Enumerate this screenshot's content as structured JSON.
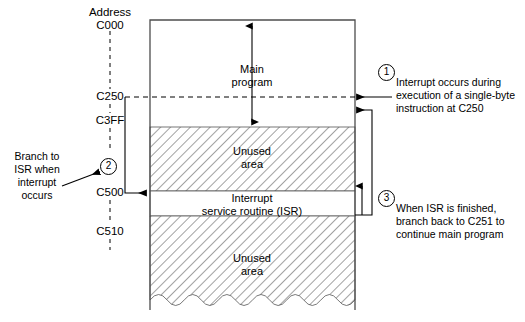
{
  "figure": {
    "type": "memory-map-interrupt-diagram"
  },
  "address_column": {
    "header": "Address",
    "labels": [
      {
        "id": "c000",
        "text": "C000"
      },
      {
        "id": "c250",
        "text": "C250"
      },
      {
        "id": "c3ff",
        "text": "C3FF"
      },
      {
        "id": "c500",
        "text": "C500"
      },
      {
        "id": "c510",
        "text": "C510"
      }
    ]
  },
  "memory_map": {
    "regions": [
      {
        "id": "main-program",
        "label_line1": "Main",
        "label_line2": "program",
        "fill": "white"
      },
      {
        "id": "unused-area-upper",
        "label_line1": "Unused",
        "label_line2": "area",
        "fill": "hatched"
      },
      {
        "id": "isr",
        "label_line1": "Interrupt",
        "label_line2": "service routine (ISR)",
        "fill": "white"
      },
      {
        "id": "unused-area-lower",
        "label_line1": "Unused",
        "label_line2": "area",
        "fill": "hatched"
      }
    ]
  },
  "annotations": [
    {
      "id": "annotation-1",
      "number": "1",
      "lines": [
        "Interrupt occurs during",
        "execution of a single-byte",
        "instruction at C250"
      ]
    },
    {
      "id": "annotation-2",
      "number": "2",
      "lines": [
        "Branch to",
        "ISR when",
        "interrupt",
        "occurs"
      ]
    },
    {
      "id": "annotation-3",
      "number": "3",
      "lines": [
        "When ISR is finished,",
        "branch back to C251 to",
        "continue main program"
      ]
    }
  ],
  "colors": {
    "line": "#000000",
    "hatch": "#8a8a8a",
    "background": "#ffffff"
  }
}
